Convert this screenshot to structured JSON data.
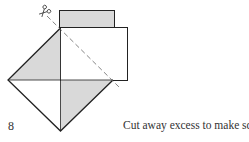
{
  "step": {
    "number": "8",
    "caption": "Cut away excess to make square."
  },
  "colors": {
    "shaded": "#d9d9d9",
    "line": "#222222",
    "dashed": "#666666",
    "paper": "#ffffff"
  },
  "icons": {
    "scissors": "scissors-icon"
  }
}
